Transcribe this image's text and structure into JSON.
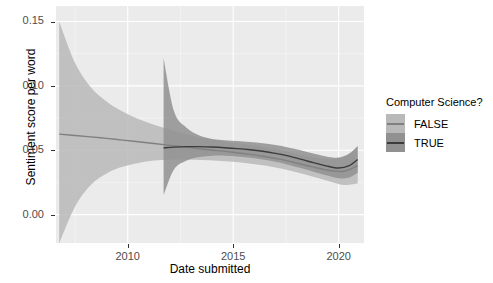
{
  "chart_data": {
    "type": "line",
    "title": "",
    "xlabel": "Date submitted",
    "ylabel": "Sentiment score per word",
    "xlim": [
      2006.6,
      2021.2
    ],
    "ylim": [
      -0.022,
      0.162
    ],
    "grid": true,
    "legend_position": "right",
    "legend_title": "Computer Science?",
    "x_ticks": [
      2010,
      2015,
      2020
    ],
    "x_tick_labels": [
      "2010",
      "2015",
      "2020"
    ],
    "y_ticks": [
      0.0,
      0.05,
      0.1,
      0.15
    ],
    "y_tick_labels": [
      "0.00",
      "0.05",
      "0.10",
      "0.15"
    ],
    "series": [
      {
        "name": "FALSE",
        "color": "#b3b3b3",
        "line_color": "#808080",
        "ribbon_color": "#b9b9b9",
        "x": [
          2006.75,
          2007.5,
          2008.25,
          2009.0,
          2009.75,
          2010.5,
          2011.25,
          2012.0,
          2012.75,
          2013.5,
          2014.25,
          2015.0,
          2015.75,
          2016.5,
          2017.25,
          2018.0,
          2018.75,
          2019.5,
          2020.25,
          2020.9
        ],
        "fit": [
          0.0625,
          0.0615,
          0.0604,
          0.0592,
          0.0579,
          0.0566,
          0.0552,
          0.0538,
          0.0524,
          0.051,
          0.0497,
          0.0484,
          0.047,
          0.0452,
          0.0429,
          0.0401,
          0.0371,
          0.0345,
          0.0337,
          0.0381
        ],
        "lower": [
          -0.0225,
          0.0062,
          0.023,
          0.032,
          0.0372,
          0.0402,
          0.042,
          0.0428,
          0.0428,
          0.0424,
          0.0418,
          0.041,
          0.0398,
          0.0381,
          0.0358,
          0.033,
          0.0297,
          0.0261,
          0.023,
          0.0241
        ],
        "upper": [
          0.15,
          0.118,
          0.099,
          0.0878,
          0.08,
          0.0742,
          0.0698,
          0.066,
          0.0626,
          0.0598,
          0.0576,
          0.0558,
          0.0542,
          0.0523,
          0.05,
          0.0472,
          0.0445,
          0.043,
          0.0447,
          0.0525
        ]
      },
      {
        "name": "TRUE",
        "color": "#666666",
        "line_color": "#3c3c3c",
        "ribbon_color": "#919191",
        "x": [
          2011.7,
          2012.2,
          2012.8,
          2013.4,
          2014.0,
          2014.6,
          2015.2,
          2015.8,
          2016.4,
          2017.0,
          2017.6,
          2018.2,
          2018.8,
          2019.4,
          2020.0,
          2020.5,
          2020.9
        ],
        "fit": [
          0.0518,
          0.0524,
          0.0528,
          0.0528,
          0.0525,
          0.052,
          0.0513,
          0.0504,
          0.0492,
          0.0476,
          0.0456,
          0.0431,
          0.0404,
          0.0379,
          0.0362,
          0.038,
          0.0428
        ],
        "lower": [
          0.0152,
          0.0352,
          0.042,
          0.0448,
          0.0458,
          0.0458,
          0.0452,
          0.0442,
          0.0428,
          0.041,
          0.0388,
          0.0362,
          0.0334,
          0.0306,
          0.0283,
          0.0289,
          0.0326
        ],
        "upper": [
          0.1215,
          0.08,
          0.0672,
          0.0614,
          0.0588,
          0.0578,
          0.0572,
          0.0564,
          0.0554,
          0.054,
          0.0522,
          0.05,
          0.0474,
          0.0452,
          0.0443,
          0.0475,
          0.0534
        ]
      }
    ]
  },
  "axes": {
    "x_title": "Date submitted",
    "y_title": "Sentiment score per word",
    "x_tick_labels": [
      "2010",
      "2015",
      "2020"
    ],
    "y_tick_labels": [
      "0.15",
      "0.10",
      "0.05",
      "0.00"
    ]
  },
  "legend": {
    "title": "Computer Science?",
    "items": [
      {
        "label": "FALSE",
        "swatch": "#b9b9b9",
        "line": "#808080"
      },
      {
        "label": "TRUE",
        "swatch": "#919191",
        "line": "#3c3c3c"
      }
    ]
  },
  "theme": {
    "panel_background": "#ebebeb",
    "grid_major": "#ffffff",
    "grid_minor": "#f5f5f5",
    "text_color": "#4d4d4d",
    "plot_background": "#ffffff"
  }
}
